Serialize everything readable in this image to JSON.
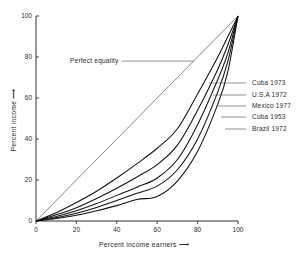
{
  "chart_data": {
    "type": "line",
    "title": "",
    "xlabel": "Percent income earners",
    "ylabel": "Percent income",
    "xlim": [
      0,
      100
    ],
    "ylim": [
      0,
      100
    ],
    "grid": false,
    "legend_position": "right-inline-leader-labels",
    "xticks": [
      0,
      20,
      40,
      60,
      80,
      100
    ],
    "yticks": [
      0,
      20,
      40,
      60,
      80,
      100
    ],
    "xtick_labels": [
      "0",
      "20",
      "40",
      "60",
      "80",
      "100"
    ],
    "ytick_labels": [
      "0",
      "20",
      "40",
      "60",
      "80",
      "100"
    ],
    "annotations": [
      {
        "text": "Perfect equality",
        "target_x": 78,
        "target_y": 78,
        "label_x": 30,
        "label_y": 78
      }
    ],
    "x": [
      0,
      10,
      20,
      30,
      40,
      50,
      60,
      70,
      80,
      90,
      95,
      100
    ],
    "series": [
      {
        "name": "Perfect equality",
        "style": "thin-straight",
        "values": [
          0,
          10,
          20,
          30,
          40,
          50,
          60,
          70,
          80,
          90,
          95,
          100
        ]
      },
      {
        "name": "Cuba 1973",
        "style": "curve",
        "values": [
          0,
          4.0,
          9.0,
          14.5,
          21.0,
          28.0,
          35.5,
          45.0,
          62.0,
          80.0,
          90.0,
          100
        ],
        "label_y_px": 83
      },
      {
        "name": "U.S.A 1972",
        "style": "curve",
        "values": [
          0,
          3.0,
          6.5,
          11.0,
          16.0,
          21.5,
          27.5,
          37.0,
          54.0,
          74.0,
          86.0,
          100
        ],
        "label_y_px": 95
      },
      {
        "name": "Mexico 1977",
        "style": "curve",
        "values": [
          0,
          2.2,
          5.0,
          8.5,
          12.5,
          16.5,
          21.0,
          30.0,
          47.0,
          69.0,
          82.0,
          100
        ],
        "label_y_px": 106
      },
      {
        "name": "Cuba 1953",
        "style": "curve",
        "values": [
          0,
          1.6,
          3.8,
          6.6,
          10.0,
          13.5,
          17.0,
          25.0,
          40.0,
          63.0,
          78.0,
          100
        ],
        "label_y_px": 117
      },
      {
        "name": "Brazil 1972",
        "style": "curve",
        "values": [
          0,
          1.2,
          2.8,
          5.0,
          7.5,
          10.5,
          12.0,
          19.5,
          34.0,
          57.0,
          73.0,
          100
        ],
        "label_y_px": 129
      }
    ]
  },
  "axes": {
    "x_title": "Percent income earners",
    "y_title": "Percent income",
    "x_arrow": "⟶",
    "y_arrow": "⟶"
  },
  "legend": {
    "items": [
      {
        "label": "Cuba 1973"
      },
      {
        "label": "U.S.A 1972"
      },
      {
        "label": "Mexico 1977"
      },
      {
        "label": "Cuba 1953"
      },
      {
        "label": "Brazil 1972"
      }
    ]
  },
  "colors": {
    "background": "#ffffff",
    "curve": "#111111",
    "equality_line": "#555555",
    "axis": "#1a1a1a",
    "text": "#2b2b2b"
  }
}
